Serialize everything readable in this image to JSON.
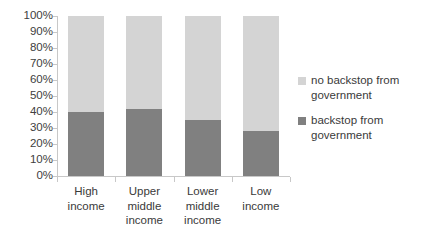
{
  "chart_data": {
    "type": "bar",
    "subtype": "100% stacked column",
    "title": "",
    "xlabel": "",
    "ylabel": "",
    "ylim": [
      0,
      100
    ],
    "grid": false,
    "legend_position": "right",
    "categories": [
      "High income",
      "Upper middle income",
      "Lower middle income",
      "Low income"
    ],
    "category_lines": [
      [
        "High",
        "income"
      ],
      [
        "Upper",
        "middle",
        "income"
      ],
      [
        "Lower",
        "middle",
        "income"
      ],
      [
        "Low",
        "income"
      ]
    ],
    "series": [
      {
        "name": "backstop from government",
        "color": "#808080",
        "values": [
          40,
          42,
          35,
          28
        ]
      },
      {
        "name": "no backstop from government",
        "color": "#d4d4d4",
        "values": [
          60,
          58,
          65,
          72
        ]
      }
    ],
    "y_ticks": [
      "100%",
      "90%",
      "80%",
      "70%",
      "60%",
      "50%",
      "40%",
      "30%",
      "20%",
      "10%",
      "0%"
    ],
    "y_tick_values": [
      100,
      90,
      80,
      70,
      60,
      50,
      40,
      30,
      20,
      10,
      0
    ]
  },
  "legend": {
    "entries": [
      {
        "label_lines": [
          "no backstop from",
          "government"
        ],
        "label": "no backstop from government",
        "color": "#d4d4d4"
      },
      {
        "label_lines": [
          "backstop from",
          "government"
        ],
        "label": "backstop from government",
        "color": "#808080"
      }
    ]
  },
  "colors": {
    "axis": "#c8c8c8",
    "text": "#3a3a3a",
    "background": "#ffffff",
    "series_dark": "#808080",
    "series_light": "#d4d4d4"
  }
}
